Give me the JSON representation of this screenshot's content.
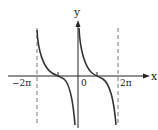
{
  "figure": {
    "type": "function-graph",
    "function_description": "cotangent-like curve with vertical asymptotes at x = -2π, 0, 2π",
    "axes": {
      "x_label": "x",
      "y_label": "y"
    },
    "tick_labels": {
      "neg_two_pi": "−2π",
      "zero": "0",
      "two_pi": "2π"
    },
    "asymptotes": [
      "−2π",
      "0",
      "2π"
    ],
    "colors": {
      "curve": "#333333",
      "axes": "#222222",
      "asymptote": "#666666"
    }
  }
}
